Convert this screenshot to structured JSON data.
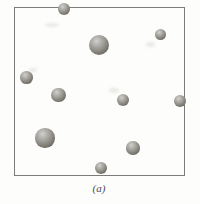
{
  "figure": {
    "caption": "(a)",
    "background_color": "#fdfdfb",
    "box": {
      "left": 13.5,
      "top": 7,
      "width": 171,
      "height": 168.5,
      "border_color": "#7b7b79"
    },
    "particle_colors": {
      "highlight": "#d2d0cc",
      "mid": "#98968f",
      "dark": "#55524c"
    },
    "particles": [
      {
        "x": 64,
        "y": 8.5,
        "r": 6
      },
      {
        "x": 160.5,
        "y": 34.5,
        "r": 5.8
      },
      {
        "x": 99,
        "y": 45,
        "r": 10
      },
      {
        "x": 26.5,
        "y": 77.5,
        "r": 6.3
      },
      {
        "x": 58.5,
        "y": 95,
        "r": 7.2
      },
      {
        "x": 122.5,
        "y": 100,
        "r": 6
      },
      {
        "x": 180,
        "y": 101,
        "r": 6
      },
      {
        "x": 45,
        "y": 138,
        "r": 9.7
      },
      {
        "x": 133,
        "y": 148,
        "r": 6.6
      },
      {
        "x": 101,
        "y": 167.5,
        "r": 6
      }
    ],
    "artifacts": [
      {
        "x": 52,
        "y": 25,
        "w": 14,
        "h": 4
      },
      {
        "x": 150,
        "y": 44,
        "w": 9,
        "h": 5
      },
      {
        "x": 114,
        "y": 90,
        "w": 10,
        "h": 5
      },
      {
        "x": 33,
        "y": 70,
        "w": 8,
        "h": 4
      }
    ],
    "caption_top": 183
  }
}
